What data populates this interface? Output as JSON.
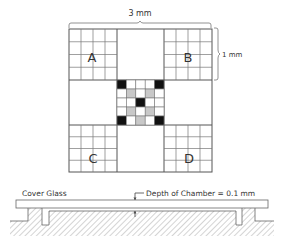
{
  "figure": {
    "top_dimension_label": "3 mm",
    "side_dimension_label": "1 mm",
    "corner_labels": {
      "a": "A",
      "b": "B",
      "c": "C",
      "d": "D"
    },
    "center_grid": {
      "rows": 5,
      "cols": 5,
      "pattern": [
        [
          "black",
          "white",
          "white",
          "white",
          "black"
        ],
        [
          "white",
          "gray",
          "white",
          "gray",
          "white"
        ],
        [
          "white",
          "white",
          "black",
          "white",
          "white"
        ],
        [
          "white",
          "gray",
          "white",
          "gray",
          "white"
        ],
        [
          "black",
          "white",
          "gray",
          "white",
          "black"
        ]
      ]
    },
    "corner_grid_divisions": 4
  },
  "cross_section": {
    "cover_glass_label": "Cover Glass",
    "depth_label": "Depth of Chamber = 0.1 mm"
  },
  "colors": {
    "line": "#555555",
    "black_cell": "#111111",
    "gray_cell": "#c8c8c8",
    "hatch": "#aaaaaa"
  }
}
